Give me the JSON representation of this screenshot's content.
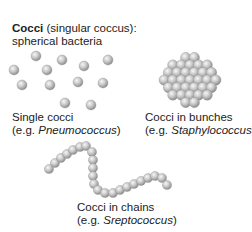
{
  "title": {
    "bold": "Cocci",
    "rest": " (singular coccus):",
    "line2": "spherical bacteria"
  },
  "groups": [
    {
      "id": "single",
      "label": "Single cocci",
      "example_prefix": "(e.g. ",
      "example_genus": "Pneumococcus",
      "example_suffix": ")"
    },
    {
      "id": "bunches",
      "label": "Cocci in bunches",
      "example_prefix": "(e.g. ",
      "example_genus": "Staphylococcus",
      "example_suffix": ")"
    },
    {
      "id": "chains",
      "label": "Cocci in chains",
      "example_prefix": "(e.g. ",
      "example_genus": "Sreptococcus",
      "example_suffix": ")"
    }
  ],
  "colors": {
    "sphere_light": "#f2f2f2",
    "sphere_mid": "#bdbdbd",
    "sphere_dark": "#8a8a8a",
    "text": "#222222"
  },
  "single_cocci_positions": [
    [
      36,
      56
    ],
    [
      62,
      60
    ],
    [
      14,
      70
    ],
    [
      47,
      70
    ],
    [
      84,
      66
    ],
    [
      108,
      60
    ],
    [
      22,
      85
    ],
    [
      50,
      85
    ],
    [
      78,
      82
    ],
    [
      103,
      83
    ],
    [
      65,
      103
    ],
    [
      91,
      105
    ]
  ],
  "chain_positions": [
    [
      49,
      169
    ],
    [
      55,
      163
    ],
    [
      61,
      158
    ],
    [
      67,
      154
    ],
    [
      73,
      150
    ],
    [
      80,
      147
    ],
    [
      86,
      146
    ],
    [
      92,
      152
    ],
    [
      93,
      160
    ],
    [
      93,
      168
    ],
    [
      93,
      176
    ],
    [
      94,
      184
    ],
    [
      98,
      190
    ],
    [
      105,
      193
    ],
    [
      113,
      193
    ],
    [
      120,
      190
    ],
    [
      127,
      187
    ],
    [
      134,
      184
    ],
    [
      141,
      181
    ],
    [
      148,
      178
    ],
    [
      155,
      176
    ],
    [
      162,
      178
    ],
    [
      167,
      185
    ]
  ]
}
